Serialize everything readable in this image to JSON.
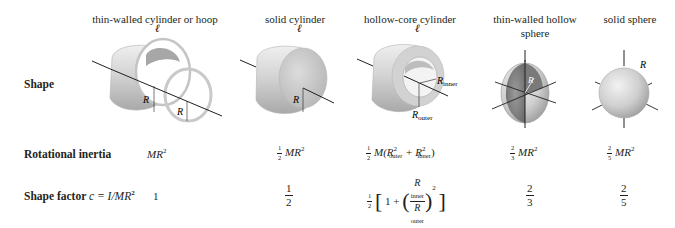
{
  "columns": [
    {
      "id": "hoop",
      "header": "thin-walled cylinder or hoop"
    },
    {
      "id": "solid-cylinder",
      "header": "solid cylinder"
    },
    {
      "id": "hollow-core-cylinder",
      "header": "hollow-core cylinder"
    },
    {
      "id": "thin-walled-hollow-sphere",
      "header_line1": "thin-walled hollow",
      "header_line2": "sphere"
    },
    {
      "id": "solid-sphere",
      "header": "solid sphere"
    }
  ],
  "rows": {
    "shape_label": "Shape",
    "inertia_label": "Rotational inertia",
    "factor_label_text": "Shape factor ",
    "factor_label_formula": "c = I/MR"
  },
  "labels": {
    "length": "ℓ",
    "radius": "R",
    "r_inner": "R",
    "r_inner_sub": "inner",
    "r_outer": "R",
    "r_outer_sub": "outer"
  },
  "inertia": {
    "hoop": "MR",
    "solid_cylinder": {
      "num": "1",
      "den": "2",
      "expr": "MR"
    },
    "hollow_core": {
      "num": "1",
      "den": "2",
      "M": "M(R",
      "plus": " + R",
      "close": ")",
      "sub_outer": "outer",
      "sub_inner": "inner"
    },
    "hollow_sphere": {
      "num": "2",
      "den": "3",
      "expr": "MR"
    },
    "solid_sphere": {
      "num": "2",
      "den": "5",
      "expr": "MR"
    },
    "exponent": "2"
  },
  "shape_factor": {
    "hoop": "1",
    "solid_cylinder": {
      "num": "1",
      "den": "2"
    },
    "hollow_core": {
      "half_num": "1",
      "half_den": "2",
      "one_plus": "1 + ",
      "ratio_num": "R",
      "ratio_num_sub": "inner",
      "ratio_den": "R",
      "ratio_den_sub": "outer",
      "exponent": "2"
    },
    "hollow_sphere": {
      "num": "2",
      "den": "3"
    },
    "solid_sphere": {
      "num": "2",
      "den": "5"
    }
  },
  "colors": {
    "text": "#231f20",
    "axis": "#231f20",
    "shape_light": "#e6e6e6",
    "shape_mid": "#bdbdbd",
    "shape_dark": "#8c8c8c"
  }
}
